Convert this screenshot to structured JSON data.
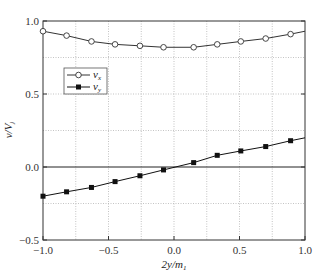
{
  "chart_data": {
    "type": "line",
    "title": "",
    "xlabel": "2y/m",
    "xlabel_sub": "1",
    "ylabel": "v/V",
    "ylabel_sub": "j",
    "xlim": [
      -1.0,
      1.0
    ],
    "ylim": [
      -0.5,
      1.0
    ],
    "grid": true,
    "legend_position": "upper-left",
    "x_ticks": [
      -1.0,
      -0.5,
      0.0,
      0.5,
      1.0
    ],
    "x_tick_labels": [
      "−1.0",
      "−0.5",
      "0.0",
      "0.5",
      "1.0"
    ],
    "y_ticks": [
      -0.5,
      0.0,
      0.5,
      1.0
    ],
    "y_tick_labels": [
      "−0.5",
      "0.0",
      "0.5",
      "1.0"
    ],
    "x_grid": [
      -0.75,
      -0.25,
      0.25,
      0.75
    ],
    "y_grid": [
      -0.25,
      0.25,
      0.75
    ],
    "series": [
      {
        "name": "v",
        "name_sub": "x",
        "marker": "open-circle",
        "color": "#333333",
        "x": [
          -1.0,
          -0.82,
          -0.63,
          -0.45,
          -0.26,
          -0.08,
          0.15,
          0.33,
          0.51,
          0.7,
          0.89
        ],
        "y": [
          0.93,
          0.9,
          0.86,
          0.84,
          0.83,
          0.82,
          0.82,
          0.84,
          0.86,
          0.88,
          0.91
        ],
        "line_end": [
          1.0,
          0.93
        ]
      },
      {
        "name": "v",
        "name_sub": "y",
        "marker": "filled-square",
        "color": "#111111",
        "x": [
          -1.0,
          -0.82,
          -0.63,
          -0.45,
          -0.26,
          -0.08,
          0.15,
          0.33,
          0.51,
          0.7,
          0.89
        ],
        "y": [
          -0.2,
          -0.17,
          -0.14,
          -0.1,
          -0.06,
          -0.02,
          0.03,
          0.08,
          0.11,
          0.14,
          0.18
        ],
        "line_end": [
          1.0,
          0.2
        ]
      }
    ]
  }
}
